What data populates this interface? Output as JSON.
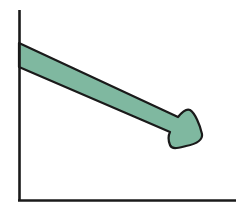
{
  "diagram": {
    "type": "downward-trend-arrow",
    "colors": {
      "background": "#ffffff",
      "axis": "#1a1a1a",
      "arrow_fill": "#7fb8a0",
      "arrow_outline": "#1a1a1a"
    },
    "axes": {
      "x_label": "",
      "y_label": ""
    },
    "arrow": {
      "direction": "down-right",
      "start": [
        19,
        55
      ],
      "end": [
        200,
        140
      ]
    }
  }
}
